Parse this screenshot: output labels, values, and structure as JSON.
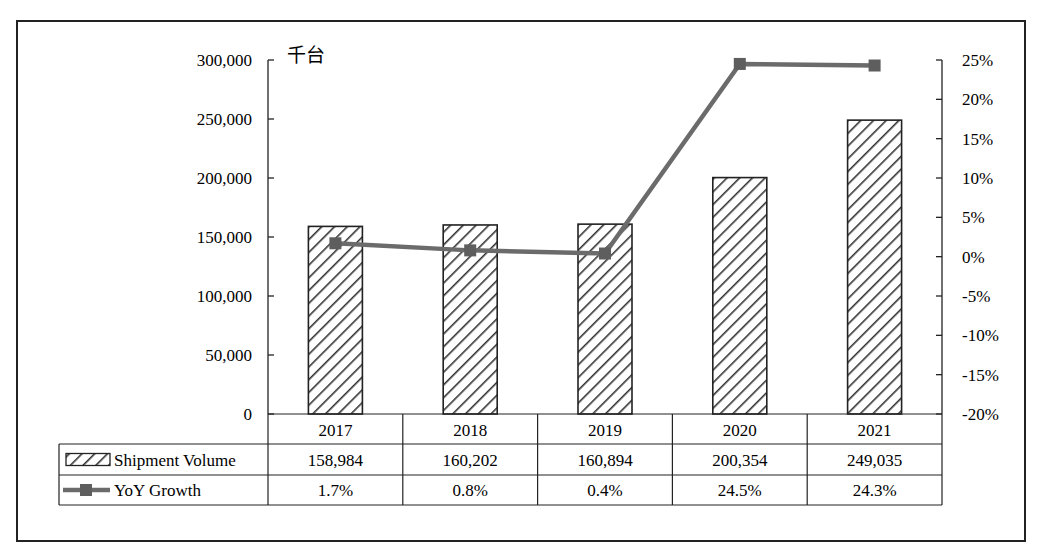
{
  "chart_data": {
    "type": "bar+line",
    "title": "",
    "unit_label": "千台",
    "categories": [
      "2017",
      "2018",
      "2019",
      "2020",
      "2021"
    ],
    "series": [
      {
        "name": "Shipment Volume",
        "type": "bar",
        "axis": "left",
        "values": [
          158984,
          160202,
          160894,
          200354,
          249035
        ],
        "labels": [
          "158,984",
          "160,202",
          "160,894",
          "200,354",
          "249,035"
        ]
      },
      {
        "name": "YoY Growth",
        "type": "line",
        "axis": "right",
        "values": [
          1.7,
          0.8,
          0.4,
          24.5,
          24.3
        ],
        "labels": [
          "1.7%",
          "0.8%",
          "0.4%",
          "24.5%",
          "24.3%"
        ]
      }
    ],
    "left_axis": {
      "ylim": [
        0,
        300000
      ],
      "ticks": [
        "300,000",
        "250,000",
        "200,000",
        "150,000",
        "100,000",
        "50,000",
        "0"
      ]
    },
    "right_axis": {
      "ylim": [
        -20,
        25
      ],
      "ticks": [
        "25%",
        "20%",
        "15%",
        "10%",
        "5%",
        "0%",
        "-5%",
        "-10%",
        "-15%",
        "-20%"
      ]
    },
    "grid": false,
    "legend_position": "data-table",
    "colors": {
      "bar_hatch": "#333333",
      "line": "#6b6b6b",
      "marker": "#5e5e5e",
      "axis": "#222222"
    }
  }
}
